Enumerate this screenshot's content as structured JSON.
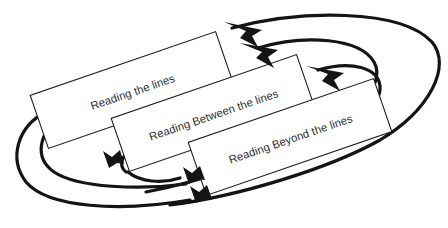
{
  "diagram": {
    "background_color": "#ffffff",
    "box_fill_color": "#ffffff",
    "box_stroke_color": "#1a1a1a",
    "arrow_color": "#141414",
    "text_color": "#2b2b2b",
    "rotation_degrees": -19,
    "boxes": [
      {
        "id": "box-reading-the-lines",
        "label": "Reading the lines",
        "order": 1
      },
      {
        "id": "box-reading-between-the-lines",
        "label": "Reading Between the lines",
        "order": 2
      },
      {
        "id": "box-reading-beyond-the-lines",
        "label": "Reading Beyond the lines",
        "order": 3
      }
    ],
    "connectors": [
      {
        "id": "connector-outer-loop",
        "from": "box-reading-beyond-the-lines",
        "to": "box-reading-the-lines",
        "direction": "feedback",
        "arrow_count": 1
      },
      {
        "id": "connector-middle-loop",
        "from": "box-reading-beyond-the-lines",
        "to": "box-reading-between-the-lines",
        "direction": "feedback",
        "arrow_count": 1
      },
      {
        "id": "connector-inner-loop",
        "from": "box-reading-beyond-the-lines",
        "to": "box-reading-beyond-the-lines",
        "direction": "feedback",
        "arrow_count": 1
      },
      {
        "id": "connector-forward-1",
        "from": "box-reading-the-lines",
        "to": "box-reading-between-the-lines",
        "direction": "forward",
        "arrow_count": 1
      },
      {
        "id": "connector-forward-2",
        "from": "box-reading-between-the-lines",
        "to": "box-reading-beyond-the-lines",
        "direction": "forward",
        "arrow_count": 1
      },
      {
        "id": "connector-forward-3",
        "from": "box-reading-the-lines",
        "to": "box-reading-beyond-the-lines",
        "direction": "forward",
        "arrow_count": 1
      }
    ]
  }
}
